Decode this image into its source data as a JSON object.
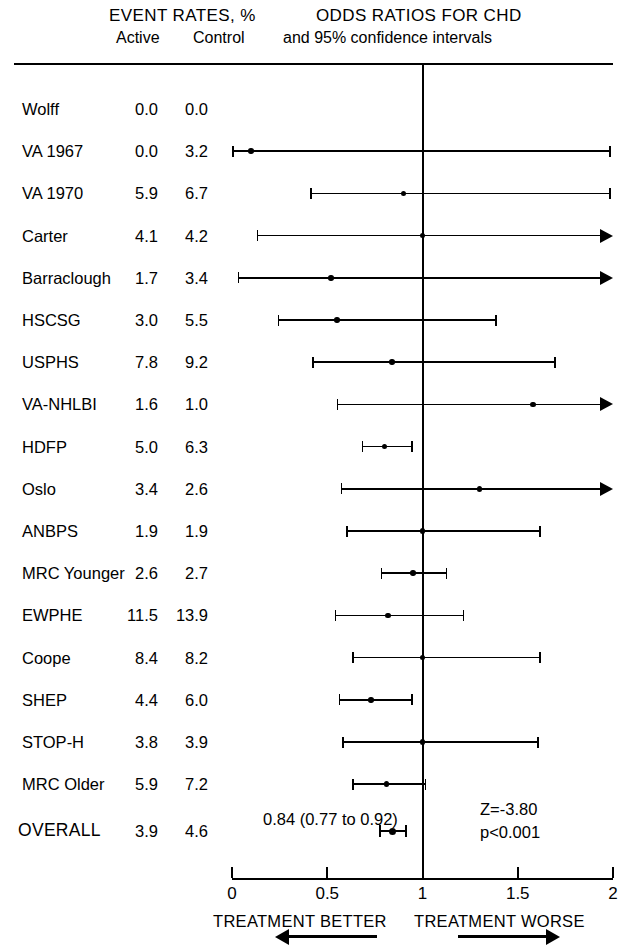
{
  "header": {
    "event_rates_title": "EVENT RATES, %",
    "active_label": "Active",
    "control_label": "Control",
    "odds_title": "ODDS RATIOS FOR CHD",
    "odds_subtitle": "and 95% confidence intervals"
  },
  "axis": {
    "ticks": [
      "0",
      "0.5",
      "1",
      "1.5",
      "2"
    ],
    "left_direction_label": "TREATMENT BETTER",
    "right_direction_label": "TREATMENT WORSE"
  },
  "summary": {
    "estimate_text": "0.84 (0.77 to 0.92)",
    "z_text": "Z=-3.80",
    "p_text": "p<0.001"
  },
  "chart_data": {
    "type": "forest",
    "title": "ODDS RATIOS FOR CHD",
    "subtitle": "and 95% confidence intervals",
    "xlabel": "Odds ratio",
    "xlim": [
      0,
      2
    ],
    "xticks": [
      0,
      0.5,
      1,
      1.5,
      2
    ],
    "null_line": 1,
    "grid": false,
    "columns": [
      "Study",
      "Active",
      "Control",
      "Odds ratio (95% CI)"
    ],
    "rows": [
      {
        "study": "Wolff",
        "active": "0.0",
        "control": "0.0",
        "or": null,
        "lo": null,
        "hi": null,
        "hi_clipped": false
      },
      {
        "study": "VA 1967",
        "active": "0.0",
        "control": "3.2",
        "or": 0.1,
        "lo": 0.0,
        "hi": 1.99,
        "hi_clipped": false
      },
      {
        "study": "VA 1970",
        "active": "5.9",
        "control": "6.7",
        "or": 0.9,
        "lo": 0.41,
        "hi": 1.99,
        "hi_clipped": false
      },
      {
        "study": "Carter",
        "active": "4.1",
        "control": "4.2",
        "or": 1.0,
        "lo": 0.13,
        "hi": 2.0,
        "hi_clipped": true
      },
      {
        "study": "Barraclough",
        "active": "1.7",
        "control": "3.4",
        "or": 0.52,
        "lo": 0.03,
        "hi": 2.0,
        "hi_clipped": true
      },
      {
        "study": "HSCSG",
        "active": "3.0",
        "control": "5.5",
        "or": 0.55,
        "lo": 0.24,
        "hi": 1.39,
        "hi_clipped": false
      },
      {
        "study": "USPHS",
        "active": "7.8",
        "control": "9.2",
        "or": 0.84,
        "lo": 0.42,
        "hi": 1.7,
        "hi_clipped": false
      },
      {
        "study": "VA-NHLBI",
        "active": "1.6",
        "control": "1.0",
        "or": 1.58,
        "lo": 0.55,
        "hi": 2.0,
        "hi_clipped": true
      },
      {
        "study": "HDFP",
        "active": "5.0",
        "control": "6.3",
        "or": 0.8,
        "lo": 0.68,
        "hi": 0.95,
        "hi_clipped": false
      },
      {
        "study": "Oslo",
        "active": "3.4",
        "control": "2.6",
        "or": 1.3,
        "lo": 0.57,
        "hi": 2.0,
        "hi_clipped": true
      },
      {
        "study": "ANBPS",
        "active": "1.9",
        "control": "1.9",
        "or": 1.0,
        "lo": 0.6,
        "hi": 1.62,
        "hi_clipped": false
      },
      {
        "study": "MRC Younger",
        "active": "2.6",
        "control": "2.7",
        "or": 0.95,
        "lo": 0.78,
        "hi": 1.13,
        "hi_clipped": false
      },
      {
        "study": "EWPHE",
        "active": "11.5",
        "control": "13.9",
        "or": 0.82,
        "lo": 0.54,
        "hi": 1.22,
        "hi_clipped": false
      },
      {
        "study": "Coope",
        "active": "8.4",
        "control": "8.2",
        "or": 1.0,
        "lo": 0.63,
        "hi": 1.62,
        "hi_clipped": false
      },
      {
        "study": "SHEP",
        "active": "4.4",
        "control": "6.0",
        "or": 0.73,
        "lo": 0.56,
        "hi": 0.95,
        "hi_clipped": false
      },
      {
        "study": "STOP-H",
        "active": "3.8",
        "control": "3.9",
        "or": 1.0,
        "lo": 0.58,
        "hi": 1.61,
        "hi_clipped": false
      },
      {
        "study": "MRC Older",
        "active": "5.9",
        "control": "7.2",
        "or": 0.81,
        "lo": 0.63,
        "hi": 1.02,
        "hi_clipped": false
      }
    ],
    "overall": {
      "study": "OVERALL",
      "active": "3.9",
      "control": "4.6",
      "or": 0.84,
      "lo": 0.77,
      "hi": 0.92,
      "label": "0.84 (0.77 to 0.92)",
      "z": "Z=-3.80",
      "p": "p<0.001"
    }
  }
}
